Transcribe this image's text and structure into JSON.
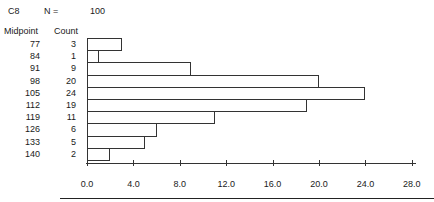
{
  "header": {
    "variable": "C8",
    "n_label": "N =",
    "n_value": "100",
    "midpoint_header": "Midpoint",
    "count_header": "Count"
  },
  "chart_data": {
    "type": "bar",
    "orientation": "horizontal",
    "xlabel": "Count",
    "ylabel": "Midpoint",
    "categories": [
      "77",
      "84",
      "91",
      "98",
      "105",
      "112",
      "119",
      "126",
      "133",
      "140"
    ],
    "values": [
      3,
      1,
      9,
      20,
      24,
      19,
      11,
      6,
      5,
      2
    ],
    "xlim": [
      0,
      28
    ],
    "x_ticks": [
      "0.0",
      "4.0",
      "8.0",
      "12.0",
      "16.0",
      "20.0",
      "24.0",
      "28.0"
    ],
    "grid": false,
    "legend": null
  },
  "rows": [
    {
      "midpoint": "77",
      "count": "3"
    },
    {
      "midpoint": "84",
      "count": "1"
    },
    {
      "midpoint": "91",
      "count": "9"
    },
    {
      "midpoint": "98",
      "count": "20"
    },
    {
      "midpoint": "105",
      "count": "24"
    },
    {
      "midpoint": "112",
      "count": "19"
    },
    {
      "midpoint": "119",
      "count": "11"
    },
    {
      "midpoint": "126",
      "count": "6"
    },
    {
      "midpoint": "133",
      "count": "5"
    },
    {
      "midpoint": "140",
      "count": "2"
    }
  ],
  "axis": {
    "ticks": [
      "0.0",
      "4.0",
      "8.0",
      "12.0",
      "16.0",
      "20.0",
      "24.0",
      "28.0"
    ]
  }
}
